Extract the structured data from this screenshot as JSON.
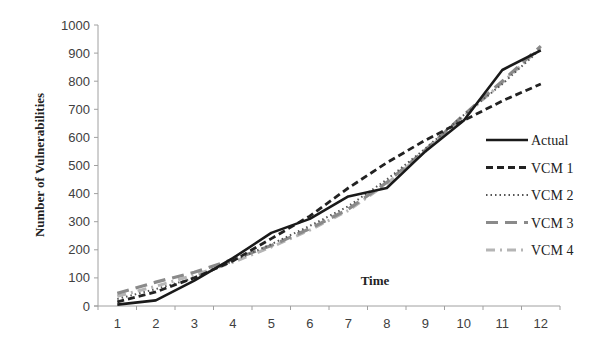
{
  "chart_data": {
    "type": "line",
    "title": "",
    "xlabel": "Time",
    "ylabel": "Number of Vulnerabilities",
    "x": [
      1,
      2,
      3,
      4,
      5,
      6,
      7,
      8,
      9,
      10,
      11,
      12
    ],
    "xticks": [
      "1",
      "2",
      "3",
      "4",
      "5",
      "6",
      "7",
      "8",
      "9",
      "10",
      "11",
      "12"
    ],
    "yticks": [
      "0",
      "100",
      "200",
      "300",
      "400",
      "500",
      "600",
      "700",
      "800",
      "900",
      "1000"
    ],
    "ylim": [
      0,
      1000
    ],
    "grid": false,
    "legend_position": "right-inside",
    "series": [
      {
        "name": "Actual",
        "style": "solid",
        "color": "#1a1a1a",
        "values": [
          5,
          20,
          90,
          170,
          260,
          310,
          390,
          420,
          550,
          660,
          840,
          910
        ]
      },
      {
        "name": "VCM 1",
        "style": "dashed",
        "color": "#222222",
        "values": [
          15,
          50,
          100,
          160,
          240,
          320,
          420,
          510,
          590,
          660,
          730,
          790
        ]
      },
      {
        "name": "VCM 2",
        "style": "dotted",
        "color": "#555555",
        "values": [
          25,
          60,
          100,
          160,
          220,
          285,
          355,
          450,
          560,
          680,
          790,
          915
        ]
      },
      {
        "name": "VCM 3",
        "style": "long-dash",
        "color": "#8a8a8a",
        "values": [
          45,
          85,
          120,
          165,
          215,
          275,
          345,
          440,
          555,
          680,
          800,
          925
        ]
      },
      {
        "name": "VCM 4",
        "style": "dash-dot",
        "color": "#b5b5b5",
        "values": [
          35,
          70,
          110,
          155,
          210,
          270,
          340,
          435,
          550,
          675,
          795,
          920
        ]
      }
    ]
  }
}
